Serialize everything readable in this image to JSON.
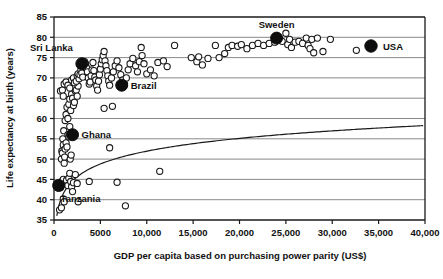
{
  "chart_data": {
    "type": "scatter",
    "title": "",
    "xlabel": "GDP per capita based on purchasing power parity (US$)",
    "ylabel": "Life expectancy at birth (years)",
    "xlim": [
      0,
      40000
    ],
    "ylim": [
      35,
      85
    ],
    "xticks": [
      0,
      5000,
      10000,
      15000,
      20000,
      25000,
      30000,
      35000,
      40000
    ],
    "xtick_labels": [
      "0",
      "5000",
      "10,000",
      "15,000",
      "20,000",
      "25,000",
      "30,000",
      "35,000",
      "40,000"
    ],
    "yticks": [
      35,
      40,
      45,
      50,
      55,
      60,
      65,
      70,
      75,
      80,
      85
    ],
    "ytick_labels": [
      "35",
      "40",
      "45",
      "50",
      "55",
      "60",
      "65",
      "70",
      "75",
      "80",
      "85"
    ],
    "grid": "horizontal",
    "legend": {
      "position": "top-right-inside",
      "entries": [
        {
          "label": "USA",
          "marker": "filled-circle",
          "color": "#0d0d0d"
        }
      ]
    },
    "series": [
      {
        "name": "Countries",
        "marker": "open-circle",
        "color": "#1a1a1a",
        "points": [
          [
            600,
            37.5
          ],
          [
            800,
            38.0
          ],
          [
            1000,
            40.2
          ],
          [
            1100,
            39.5
          ],
          [
            700,
            43.0
          ],
          [
            750,
            44.2
          ],
          [
            900,
            44.6
          ],
          [
            1000,
            45.0
          ],
          [
            1200,
            44.0
          ],
          [
            1350,
            44.8
          ],
          [
            1500,
            43.5
          ],
          [
            1600,
            45.3
          ],
          [
            1700,
            46.5
          ],
          [
            1800,
            44.5
          ],
          [
            1900,
            43.2
          ],
          [
            2000,
            42.0
          ],
          [
            2100,
            44.2
          ],
          [
            2300,
            46.2
          ],
          [
            2500,
            44.0
          ],
          [
            2600,
            39.5
          ],
          [
            3800,
            44.5
          ],
          [
            6800,
            44.3
          ],
          [
            7700,
            38.5
          ],
          [
            11400,
            47.0
          ],
          [
            800,
            50.0
          ],
          [
            850,
            52.0
          ],
          [
            900,
            51.5
          ],
          [
            950,
            55.0
          ],
          [
            1000,
            53.5
          ],
          [
            1050,
            57.0
          ],
          [
            1100,
            49.0
          ],
          [
            1150,
            50.5
          ],
          [
            1200,
            52.5
          ],
          [
            1300,
            54.0
          ],
          [
            1400,
            53.0
          ],
          [
            1500,
            56.0
          ],
          [
            1600,
            55.5
          ],
          [
            1700,
            58.0
          ],
          [
            1750,
            50.0
          ],
          [
            1850,
            51.0
          ],
          [
            6000,
            52.8
          ],
          [
            1200,
            59.5
          ],
          [
            1300,
            61.0
          ],
          [
            1400,
            62.8
          ],
          [
            1500,
            60.0
          ],
          [
            1600,
            63.5
          ],
          [
            1700,
            64.8
          ],
          [
            1800,
            62.0
          ],
          [
            1900,
            66.0
          ],
          [
            2000,
            65.0
          ],
          [
            2100,
            63.2
          ],
          [
            2200,
            64.0
          ],
          [
            2300,
            66.8
          ],
          [
            2400,
            67.0
          ],
          [
            2500,
            65.5
          ],
          [
            2600,
            68.0
          ],
          [
            5400,
            62.5
          ],
          [
            6300,
            63.0
          ],
          [
            700,
            66.8
          ],
          [
            900,
            67.0
          ],
          [
            1000,
            65.5
          ],
          [
            1100,
            68.5
          ],
          [
            1300,
            69.0
          ],
          [
            1500,
            68.2
          ],
          [
            1700,
            67.5
          ],
          [
            1900,
            69.5
          ],
          [
            2100,
            70.0
          ],
          [
            2200,
            68.8
          ],
          [
            2400,
            69.2
          ],
          [
            2500,
            70.5
          ],
          [
            2600,
            71.0
          ],
          [
            2700,
            69.8
          ],
          [
            2800,
            70.8
          ],
          [
            2900,
            72.0
          ],
          [
            3000,
            71.2
          ],
          [
            3100,
            70.2
          ],
          [
            3200,
            73.0
          ],
          [
            3300,
            74.0
          ],
          [
            3400,
            73.5
          ],
          [
            3500,
            72.5
          ],
          [
            3600,
            71.5
          ],
          [
            3700,
            70.0
          ],
          [
            3800,
            68.5
          ],
          [
            3900,
            69.0
          ],
          [
            4000,
            70.5
          ],
          [
            4100,
            72.0
          ],
          [
            4200,
            73.8
          ],
          [
            4300,
            71.8
          ],
          [
            4400,
            70.2
          ],
          [
            4500,
            69.5
          ],
          [
            4600,
            68.0
          ],
          [
            4700,
            67.0
          ],
          [
            4800,
            69.2
          ],
          [
            4900,
            70.8
          ],
          [
            5000,
            72.2
          ],
          [
            5100,
            73.5
          ],
          [
            5200,
            74.5
          ],
          [
            5300,
            75.5
          ],
          [
            5400,
            76.5
          ],
          [
            5500,
            74.2
          ],
          [
            5600,
            73.0
          ],
          [
            5700,
            71.8
          ],
          [
            5800,
            70.5
          ],
          [
            5900,
            69.2
          ],
          [
            6000,
            68.2
          ],
          [
            6200,
            70.0
          ],
          [
            6400,
            71.5
          ],
          [
            6600,
            73.0
          ],
          [
            6800,
            74.2
          ],
          [
            7000,
            72.5
          ],
          [
            7200,
            70.8
          ],
          [
            7400,
            69.5
          ],
          [
            7600,
            68.5
          ],
          [
            7800,
            70.0
          ],
          [
            8000,
            72.0
          ],
          [
            8200,
            73.5
          ],
          [
            8500,
            74.8
          ],
          [
            8800,
            73.0
          ],
          [
            9000,
            71.5
          ],
          [
            9200,
            74.0
          ],
          [
            9400,
            77.5
          ],
          [
            9500,
            75.5
          ],
          [
            9700,
            73.5
          ],
          [
            10000,
            71.0
          ],
          [
            10400,
            72.0
          ],
          [
            10800,
            70.5
          ],
          [
            11200,
            73.8
          ],
          [
            11800,
            74.2
          ],
          [
            12200,
            72.8
          ],
          [
            13000,
            78.0
          ],
          [
            14800,
            75.0
          ],
          [
            15400,
            74.0
          ],
          [
            15600,
            75.2
          ],
          [
            16000,
            73.2
          ],
          [
            16600,
            74.8
          ],
          [
            17400,
            78.0
          ],
          [
            17800,
            75.0
          ],
          [
            18400,
            76.0
          ],
          [
            18800,
            77.5
          ],
          [
            19200,
            78.0
          ],
          [
            19800,
            77.8
          ],
          [
            20200,
            78.2
          ],
          [
            20800,
            77.2
          ],
          [
            21400,
            78.0
          ],
          [
            22000,
            78.5
          ],
          [
            22600,
            78.0
          ],
          [
            23200,
            78.5
          ],
          [
            23800,
            78.8
          ],
          [
            24600,
            79.0
          ],
          [
            25000,
            81.0
          ],
          [
            25200,
            78.2
          ],
          [
            25400,
            79.5
          ],
          [
            25600,
            77.5
          ],
          [
            26000,
            78.8
          ],
          [
            26400,
            79.0
          ],
          [
            26800,
            78.5
          ],
          [
            27200,
            79.8
          ],
          [
            27400,
            78.0
          ],
          [
            27600,
            77.2
          ],
          [
            27800,
            79.5
          ],
          [
            28000,
            76.2
          ],
          [
            28400,
            79.8
          ],
          [
            29000,
            76.5
          ],
          [
            29800,
            79.5
          ],
          [
            32600,
            76.8
          ]
        ]
      }
    ],
    "highlighted_points": [
      {
        "label": "Tanzania",
        "x": 500,
        "y": 43.5,
        "marker": "filled-circle",
        "label_position": "below-right"
      },
      {
        "label": "Ghana",
        "x": 2000,
        "y": 56.0,
        "marker": "filled-circle",
        "label_position": "right"
      },
      {
        "label": "Sri Lanka",
        "x": 3000,
        "y": 73.5,
        "marker": "filled-circle",
        "label_position": "above-left"
      },
      {
        "label": "Brazil",
        "x": 7300,
        "y": 68.2,
        "marker": "filled-circle",
        "label_position": "right"
      },
      {
        "label": "Sweden",
        "x": 24000,
        "y": 79.8,
        "marker": "filled-circle",
        "label_position": "above"
      }
    ],
    "trendline": {
      "type": "logarithmic-fit",
      "description": "rising log curve through the cloud, from low GDP/low life expectancy to high GDP/high life expectancy"
    }
  },
  "axes": {
    "x_title": "GDP per capita based on purchasing power parity (US$)",
    "y_title": "Life expectancy at birth (years)"
  },
  "legend": {
    "usa_label": "USA"
  }
}
